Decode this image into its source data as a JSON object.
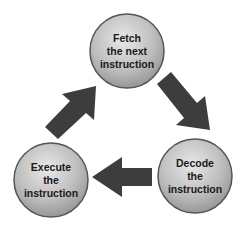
{
  "diagram": {
    "nodes": [
      {
        "id": "fetch",
        "lines": [
          "Fetch",
          "the next",
          "instruction"
        ]
      },
      {
        "id": "decode",
        "lines": [
          "Decode",
          "the",
          "instruction"
        ]
      },
      {
        "id": "execute",
        "lines": [
          "Execute",
          "the",
          "instruction"
        ]
      }
    ],
    "edges": [
      {
        "from": "fetch",
        "to": "decode"
      },
      {
        "from": "decode",
        "to": "execute"
      },
      {
        "from": "execute",
        "to": "fetch"
      }
    ],
    "colors": {
      "circle_fill_light": "#e6e6e6",
      "circle_fill_dark": "#9a9a9a",
      "circle_stroke": "#555555",
      "arrow": "#3d3d3d"
    }
  }
}
